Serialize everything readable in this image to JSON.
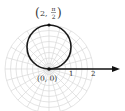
{
  "diagram": {
    "type": "polar-graph",
    "curve": "circle r = 2 sin(theta)",
    "point_top_label": {
      "open": "(",
      "r": "2,",
      "theta_num": "π",
      "theta_den": "2",
      "close": ")"
    },
    "pole_label": "(0, 0)",
    "tick_labels": [
      "1",
      "2"
    ],
    "colors": {
      "grid": "#d9d9d9",
      "curve": "#1a1a1a",
      "axis": "#111111",
      "text": "#333333"
    }
  }
}
